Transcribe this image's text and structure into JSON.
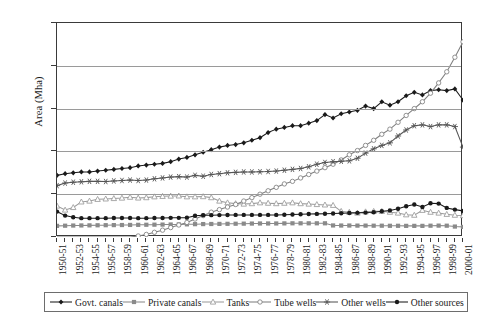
{
  "chart_data": {
    "type": "line",
    "title": "",
    "xlabel": "",
    "ylabel": "Area (Mha)",
    "ylim": [
      0,
      25
    ],
    "yticks": [
      0,
      5,
      10,
      15,
      20,
      25
    ],
    "grid": true,
    "legend_position": "bottom",
    "x": [
      "1950-51",
      "1951-52",
      "1952-53",
      "1953-54",
      "1954-55",
      "1955-56",
      "1956-57",
      "1957-58",
      "1958-59",
      "1959-60",
      "1960-61",
      "1961-62",
      "1962-63",
      "1963-64",
      "1964-65",
      "1965-66",
      "1966-67",
      "1967-68",
      "1968-69",
      "1969-70",
      "1970-71",
      "1971-72",
      "1972-73",
      "1973-74",
      "1974-75",
      "1975-76",
      "1976-77",
      "1977-78",
      "1978-79",
      "1979-80",
      "1980-81",
      "1981-82",
      "1982-83",
      "1983-84",
      "1984-85",
      "1985-86",
      "1986-87",
      "1987-88",
      "1988-89",
      "1989-90",
      "1990-91",
      "1991-92",
      "1992-93",
      "1993-94",
      "1994-95",
      "1995-96",
      "1996-97",
      "1997-98",
      "1998-99",
      "1999-2000",
      "2000-01"
    ],
    "xtick_labels": [
      "1950-51",
      "1952-53",
      "1954-55",
      "1956-57",
      "1958-59",
      "1960-61",
      "1962-63",
      "1964-65",
      "1966-67",
      "1968-69",
      "1970-71",
      "1972-73",
      "1974-75",
      "1976-77",
      "1978-79",
      "1980-81",
      "1982-83",
      "1984-85",
      "1986-87",
      "1988-89",
      "1990-91",
      "1992-93",
      "1994-95",
      "1996-97",
      "1998-99",
      "2000-01"
    ],
    "series": [
      {
        "name": "Govt. canals",
        "color": "#1a1a1a",
        "marker": "diamond-filled",
        "values": [
          7.2,
          7.4,
          7.5,
          7.6,
          7.6,
          7.7,
          7.8,
          7.9,
          8.0,
          8.1,
          8.3,
          8.4,
          8.5,
          8.6,
          8.8,
          9.1,
          9.3,
          9.6,
          9.9,
          10.2,
          10.5,
          10.7,
          10.8,
          11.0,
          11.3,
          11.6,
          12.2,
          12.6,
          12.8,
          13.0,
          13.0,
          13.3,
          13.6,
          14.3,
          13.9,
          14.4,
          14.6,
          14.8,
          15.3,
          15.0,
          15.8,
          15.4,
          15.8,
          16.5,
          16.9,
          16.6,
          17.1,
          17.2,
          17.1,
          17.3,
          16.0
        ]
      },
      {
        "name": "Private canals",
        "color": "#8a8a8a",
        "marker": "square-filled",
        "values": [
          1.3,
          1.32,
          1.34,
          1.35,
          1.36,
          1.37,
          1.38,
          1.39,
          1.4,
          1.41,
          1.42,
          1.43,
          1.44,
          1.45,
          1.46,
          1.47,
          1.48,
          1.5,
          1.51,
          1.52,
          1.53,
          1.54,
          1.55,
          1.56,
          1.57,
          1.58,
          1.58,
          1.58,
          1.59,
          1.6,
          1.6,
          1.6,
          1.6,
          1.6,
          1.35,
          1.34,
          1.34,
          1.33,
          1.33,
          1.32,
          1.32,
          1.31,
          1.31,
          1.3,
          1.3,
          1.3,
          1.32,
          1.33,
          1.32,
          1.22,
          1.18
        ]
      },
      {
        "name": "Tanks",
        "color": "#9b9b9b",
        "marker": "triangle-open",
        "values": [
          3.62,
          3.15,
          3.45,
          4.1,
          4.2,
          4.4,
          4.45,
          4.5,
          4.55,
          4.65,
          4.56,
          4.6,
          4.7,
          4.75,
          4.78,
          4.8,
          4.7,
          4.7,
          4.72,
          4.6,
          4.2,
          4.0,
          3.9,
          3.85,
          3.9,
          4.0,
          3.95,
          3.9,
          3.95,
          4.0,
          3.9,
          3.85,
          3.8,
          3.75,
          3.7,
          3.0,
          2.9,
          2.8,
          2.95,
          3.0,
          3.0,
          2.9,
          2.8,
          2.6,
          2.55,
          3.12,
          2.9,
          2.8,
          2.65,
          2.55,
          2.5
        ]
      },
      {
        "name": "Tube wells",
        "color": "#7f7f7f",
        "marker": "circle-open",
        "values": [
          0.0,
          0.0,
          0.0,
          0.0,
          0.0,
          0.0,
          0.0,
          0.0,
          0.0,
          0.0,
          0.12,
          0.3,
          0.55,
          0.8,
          1.1,
          1.4,
          1.7,
          2.1,
          2.5,
          2.9,
          3.2,
          3.5,
          3.8,
          4.2,
          4.6,
          5.0,
          5.4,
          5.8,
          6.2,
          6.5,
          6.9,
          7.3,
          7.7,
          8.1,
          8.5,
          9.0,
          9.6,
          10.1,
          10.7,
          11.3,
          12.0,
          12.6,
          13.4,
          14.2,
          15.0,
          15.8,
          16.8,
          18.0,
          19.3,
          21.0,
          22.8
        ]
      },
      {
        "name": "Other wells",
        "color": "#555555",
        "marker": "star",
        "values": [
          6.0,
          6.3,
          6.4,
          6.45,
          6.5,
          6.5,
          6.48,
          6.55,
          6.6,
          6.65,
          6.6,
          6.65,
          6.8,
          6.9,
          7.0,
          7.05,
          7.0,
          7.2,
          7.1,
          7.3,
          7.4,
          7.5,
          7.55,
          7.6,
          7.6,
          7.62,
          7.65,
          7.7,
          7.8,
          7.9,
          8.0,
          8.2,
          8.5,
          8.7,
          8.8,
          8.85,
          8.9,
          9.2,
          9.8,
          10.3,
          10.7,
          11.0,
          11.8,
          12.5,
          13.0,
          13.1,
          12.9,
          13.1,
          13.1,
          12.9,
          10.5
        ]
      },
      {
        "name": "Other sources",
        "color": "#1a1a1a",
        "marker": "circle-filled",
        "values": [
          2.97,
          2.5,
          2.3,
          2.2,
          2.2,
          2.2,
          2.2,
          2.22,
          2.22,
          2.22,
          2.2,
          2.2,
          2.22,
          2.22,
          2.24,
          2.24,
          2.26,
          2.48,
          2.55,
          2.55,
          2.56,
          2.57,
          2.58,
          2.58,
          2.58,
          2.58,
          2.58,
          2.58,
          2.6,
          2.62,
          2.65,
          2.68,
          2.7,
          2.72,
          2.75,
          2.78,
          2.8,
          2.82,
          2.85,
          2.9,
          3.0,
          3.1,
          3.3,
          3.6,
          3.8,
          3.5,
          3.95,
          3.9,
          3.4,
          3.2,
          3.05
        ]
      }
    ]
  }
}
